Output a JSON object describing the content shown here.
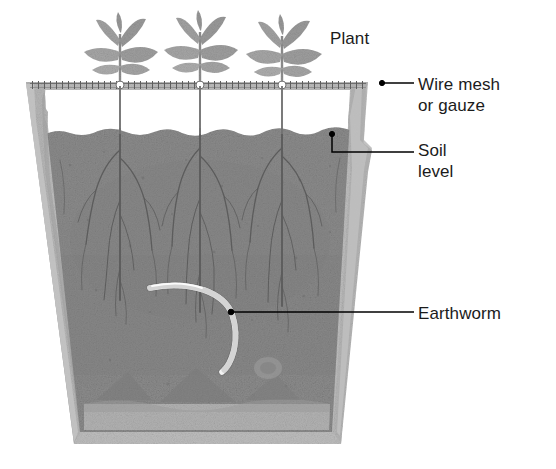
{
  "diagram": {
    "labels": {
      "plant": "Plant",
      "wire_mesh": "Wire mesh\nor gauze",
      "soil_level": "Soil\nlevel",
      "earthworm": "Earthworm"
    },
    "colors": {
      "background": "#ffffff",
      "text": "#1b1b1b",
      "leader_line": "#000000",
      "pot_wall": "#b9b9b9",
      "pot_wall_dark": "#a3a3a3",
      "soil": "#8d8d8d",
      "soil_dark": "#787878",
      "drainage": "#b2b2b2",
      "root": "#5f5f5f",
      "plant": "#9b9b9b",
      "mesh": "#6e6e6e",
      "earthworm": "#f2f2f2"
    },
    "parts": [
      {
        "name": "plant",
        "count": 3,
        "description": "Seedlings with leaf rosettes above the mesh"
      },
      {
        "name": "wire-mesh",
        "description": "Horizontal dashed gauze across pot rim"
      },
      {
        "name": "air-gap",
        "description": "White space between mesh and soil surface"
      },
      {
        "name": "soil",
        "description": "Granular grey soil with root network"
      },
      {
        "name": "earthworm",
        "description": "Pale curved segmented worm in mid soil"
      },
      {
        "name": "drainage-layer",
        "description": "Lighter band at pot base"
      },
      {
        "name": "pot",
        "description": "Tapered pot walls with rim lip"
      }
    ]
  }
}
